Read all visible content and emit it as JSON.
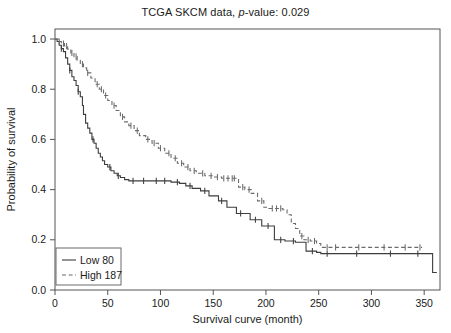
{
  "chart_data": {
    "type": "line",
    "title": "TCGA SKCM data, p-value: 0.029",
    "title_prefix": "TCGA SKCM data, ",
    "title_italic": "p",
    "title_suffix": "-value: 0.029",
    "p_value": 0.029,
    "xlabel": "Survival curve (month)",
    "ylabel": "Probability of survival",
    "xlim": [
      0,
      365
    ],
    "ylim": [
      0,
      1.04
    ],
    "xticks": [
      0,
      50,
      100,
      150,
      200,
      250,
      300,
      350
    ],
    "xtick_labels": [
      "0",
      "50",
      "100",
      "150",
      "200",
      "250",
      "300",
      "350"
    ],
    "yticks": [
      0.0,
      0.2,
      0.4,
      0.6,
      0.8,
      1.0
    ],
    "ytick_labels": [
      "0.0",
      "0.2",
      "0.4",
      "0.6",
      "0.8",
      "1.0"
    ],
    "grid": false,
    "legend_position": "bottom-left",
    "series": [
      {
        "name": "Low 80",
        "label": "Low 80",
        "n": 80,
        "group": "Low",
        "style": "solid",
        "color": "#3d3d3d",
        "points": [
          [
            0,
            1.0
          ],
          [
            2,
            0.99
          ],
          [
            4,
            0.975
          ],
          [
            6,
            0.962
          ],
          [
            8,
            0.95
          ],
          [
            10,
            0.925
          ],
          [
            12,
            0.9
          ],
          [
            14,
            0.875
          ],
          [
            16,
            0.85
          ],
          [
            18,
            0.835
          ],
          [
            20,
            0.815
          ],
          [
            22,
            0.79
          ],
          [
            24,
            0.77
          ],
          [
            26,
            0.735
          ],
          [
            27,
            0.7
          ],
          [
            29,
            0.665
          ],
          [
            31,
            0.645
          ],
          [
            33,
            0.625
          ],
          [
            35,
            0.6
          ],
          [
            37,
            0.585
          ],
          [
            39,
            0.565
          ],
          [
            41,
            0.545
          ],
          [
            43,
            0.53
          ],
          [
            45,
            0.515
          ],
          [
            47,
            0.5
          ],
          [
            50,
            0.49
          ],
          [
            53,
            0.475
          ],
          [
            56,
            0.465
          ],
          [
            59,
            0.455
          ],
          [
            62,
            0.448
          ],
          [
            66,
            0.44
          ],
          [
            70,
            0.435
          ],
          [
            78,
            0.435
          ],
          [
            90,
            0.435
          ],
          [
            100,
            0.435
          ],
          [
            110,
            0.43
          ],
          [
            118,
            0.425
          ],
          [
            124,
            0.415
          ],
          [
            130,
            0.405
          ],
          [
            138,
            0.395
          ],
          [
            146,
            0.375
          ],
          [
            155,
            0.355
          ],
          [
            163,
            0.33
          ],
          [
            172,
            0.305
          ],
          [
            185,
            0.28
          ],
          [
            196,
            0.255
          ],
          [
            208,
            0.2
          ],
          [
            218,
            0.195
          ],
          [
            228,
            0.19
          ],
          [
            238,
            0.155
          ],
          [
            248,
            0.15
          ],
          [
            252,
            0.145
          ],
          [
            300,
            0.145
          ],
          [
            340,
            0.145
          ],
          [
            356,
            0.145
          ],
          [
            358,
            0.07
          ],
          [
            362,
            0.07
          ]
        ],
        "censor_times": [
          6,
          14,
          22,
          36,
          52,
          60,
          74,
          84,
          96,
          104,
          116,
          128,
          142,
          158,
          176,
          190,
          202,
          214,
          226,
          244,
          258,
          286,
          318,
          344
        ]
      },
      {
        "name": "High 187",
        "label": "High 187",
        "n": 187,
        "group": "High",
        "style": "dashed",
        "color": "#6b6b6b",
        "points": [
          [
            0,
            1.0
          ],
          [
            3,
            0.99
          ],
          [
            6,
            0.982
          ],
          [
            9,
            0.972
          ],
          [
            12,
            0.96
          ],
          [
            15,
            0.945
          ],
          [
            18,
            0.93
          ],
          [
            21,
            0.915
          ],
          [
            24,
            0.9
          ],
          [
            27,
            0.885
          ],
          [
            30,
            0.865
          ],
          [
            34,
            0.845
          ],
          [
            38,
            0.82
          ],
          [
            42,
            0.8
          ],
          [
            46,
            0.775
          ],
          [
            50,
            0.755
          ],
          [
            54,
            0.735
          ],
          [
            58,
            0.715
          ],
          [
            62,
            0.69
          ],
          [
            66,
            0.67
          ],
          [
            70,
            0.655
          ],
          [
            75,
            0.635
          ],
          [
            80,
            0.615
          ],
          [
            86,
            0.6
          ],
          [
            92,
            0.585
          ],
          [
            98,
            0.565
          ],
          [
            104,
            0.545
          ],
          [
            110,
            0.525
          ],
          [
            116,
            0.505
          ],
          [
            122,
            0.49
          ],
          [
            128,
            0.475
          ],
          [
            134,
            0.465
          ],
          [
            142,
            0.455
          ],
          [
            150,
            0.45
          ],
          [
            158,
            0.445
          ],
          [
            166,
            0.445
          ],
          [
            172,
            0.445
          ],
          [
            174,
            0.41
          ],
          [
            180,
            0.4
          ],
          [
            186,
            0.385
          ],
          [
            192,
            0.355
          ],
          [
            198,
            0.33
          ],
          [
            202,
            0.325
          ],
          [
            212,
            0.325
          ],
          [
            216,
            0.32
          ],
          [
            220,
            0.3
          ],
          [
            224,
            0.265
          ],
          [
            228,
            0.245
          ],
          [
            232,
            0.215
          ],
          [
            236,
            0.2
          ],
          [
            242,
            0.195
          ],
          [
            248,
            0.185
          ],
          [
            252,
            0.17
          ],
          [
            300,
            0.17
          ],
          [
            340,
            0.17
          ],
          [
            348,
            0.17
          ]
        ],
        "censor_times": [
          4,
          8,
          11,
          16,
          20,
          26,
          31,
          40,
          44,
          48,
          56,
          64,
          72,
          78,
          88,
          94,
          100,
          108,
          114,
          120,
          126,
          132,
          140,
          148,
          154,
          160,
          164,
          168,
          170,
          178,
          184,
          196,
          206,
          210,
          214,
          234,
          240,
          246,
          258,
          266,
          288,
          312,
          332,
          346
        ]
      }
    ]
  },
  "legend": {
    "items": [
      {
        "label": "Low 80",
        "style": "solid"
      },
      {
        "label": "High 187",
        "style": "dashed"
      }
    ]
  }
}
